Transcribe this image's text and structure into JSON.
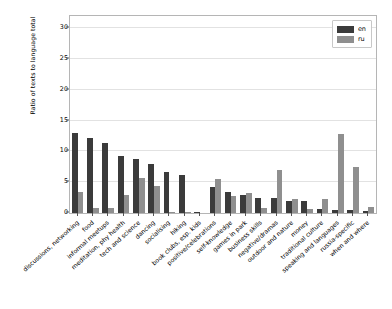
{
  "chart_data": {
    "type": "bar",
    "title": "",
    "xlabel": "",
    "ylabel": "Ratio of texts to language total",
    "ylim": [
      0,
      32
    ],
    "yticks": [
      0,
      5,
      10,
      15,
      20,
      25,
      30
    ],
    "grid": true,
    "legend_position": "upper right",
    "categories": [
      "discussions, networking",
      "food",
      "informal meetups",
      "meditation, phy health",
      "tech and science",
      "dancing",
      "socialising",
      "hiking",
      "book clubs, esp. kids",
      "positive/celebrations",
      "self-knowledge",
      "games in park",
      "business skills",
      "negative/dramas",
      "outdoor and nature",
      "money",
      "traditional culture",
      "speaking and languages",
      "russia-specific",
      "when and where"
    ],
    "series": [
      {
        "name": "en",
        "color": "#3b3b3b",
        "values": [
          13.0,
          12.2,
          11.4,
          9.3,
          8.7,
          7.9,
          6.7,
          6.1,
          0.15,
          4.2,
          3.4,
          2.9,
          2.5,
          2.4,
          2.0,
          2.0,
          0.6,
          0.55,
          0.5,
          0.3
        ]
      },
      {
        "name": "ru",
        "color": "#8f8f8f",
        "values": [
          3.4,
          0.85,
          0.8,
          3.0,
          5.7,
          4.4,
          0.1,
          0.15,
          0.0,
          5.5,
          2.8,
          3.3,
          0.75,
          7.0,
          2.3,
          0.7,
          2.2,
          12.9,
          7.5,
          1.0
        ]
      }
    ]
  },
  "legend": {
    "entries": [
      {
        "label": "en"
      },
      {
        "label": "ru"
      }
    ]
  },
  "axes": {
    "ytick_labels": [
      "0",
      "5",
      "10",
      "15",
      "20",
      "25",
      "30"
    ]
  }
}
